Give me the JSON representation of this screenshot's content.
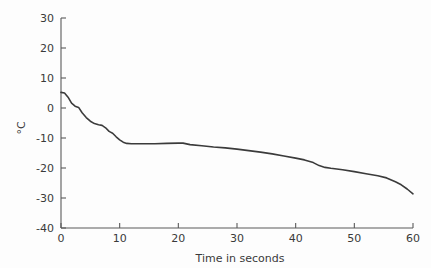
{
  "chart_data": {
    "type": "line",
    "title": "",
    "subtitle": "",
    "xlabel": "Time in seconds",
    "ylabel": "°C",
    "xlim": [
      0,
      60
    ],
    "ylim": [
      -40,
      30
    ],
    "xticks": [
      0,
      10,
      20,
      30,
      40,
      50,
      60
    ],
    "yticks": [
      -40,
      -30,
      -20,
      -10,
      0,
      10,
      20,
      30
    ],
    "xtick_labels": [
      "0",
      "10",
      "20",
      "30",
      "40",
      "50",
      "60"
    ],
    "ytick_labels": [
      "-40",
      "-30",
      "-20",
      "-10",
      "0",
      "10",
      "20",
      "30"
    ],
    "grid": false,
    "legend": null,
    "legend_position": "none",
    "annotations": [],
    "series": [
      {
        "name": "Temperature",
        "color": "#3b3b3b",
        "x": [
          0.0,
          0.6,
          1.2,
          1.8,
          2.4,
          3.0,
          3.6,
          4.3,
          5.0,
          5.7,
          6.4,
          7.0,
          7.6,
          8.2,
          8.8,
          9.4,
          10.0,
          10.6,
          11.2,
          12.0,
          14.0,
          16.0,
          18.0,
          20.0,
          20.8,
          22.0,
          24.0,
          26.0,
          28.0,
          30.0,
          32.0,
          34.0,
          36.0,
          38.0,
          40.0,
          41.5,
          43.0,
          44.0,
          45.0,
          46.0,
          48.0,
          50.0,
          52.0,
          54.0,
          55.5,
          57.0,
          58.0,
          59.0,
          60.0
        ],
        "y": [
          5.2,
          5.0,
          3.6,
          1.6,
          0.6,
          0.2,
          -1.6,
          -3.2,
          -4.4,
          -5.2,
          -5.6,
          -5.8,
          -6.6,
          -7.8,
          -8.4,
          -9.6,
          -10.6,
          -11.4,
          -11.8,
          -11.9,
          -11.9,
          -11.9,
          -11.8,
          -11.7,
          -11.7,
          -12.2,
          -12.6,
          -13.0,
          -13.3,
          -13.7,
          -14.2,
          -14.7,
          -15.3,
          -16.0,
          -16.7,
          -17.3,
          -18.2,
          -19.2,
          -19.8,
          -20.1,
          -20.6,
          -21.2,
          -21.9,
          -22.6,
          -23.3,
          -24.6,
          -25.6,
          -27.0,
          -28.6
        ]
      }
    ]
  },
  "axes": {
    "y_axis_label": "°C",
    "x_axis_label": "Time in seconds"
  }
}
